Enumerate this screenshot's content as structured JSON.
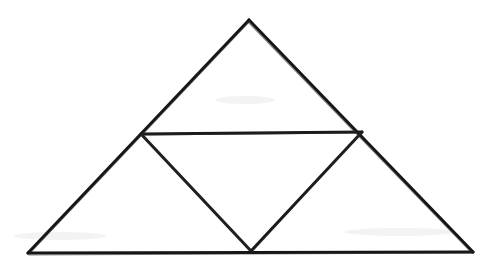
{
  "figure": {
    "background_color": "#ffffff",
    "stroke_color": "#161616",
    "stroke_width_px": 3,
    "width_px": 493,
    "height_px": 270,
    "style": "hand-drawn ink line drawing, scanned"
  },
  "vertices": {
    "apex": {
      "label": "apex",
      "x": 249,
      "y": 20
    },
    "bottom_left": {
      "label": "bottom-left",
      "x": 28,
      "y": 253
    },
    "bottom_right": {
      "label": "bottom-right",
      "x": 473,
      "y": 252
    },
    "left_midpoint": {
      "label": "left-midpoint",
      "x": 141,
      "y": 134
    },
    "right_midpoint": {
      "label": "right-midpoint",
      "x": 362,
      "y": 132
    },
    "bottom_midpoint": {
      "label": "bottom-midpoint",
      "x": 251,
      "y": 251
    }
  },
  "segments": [
    {
      "name": "outer-left-edge",
      "from": "apex",
      "to": "bottom_left",
      "path": "M 249 20 L 28 253"
    },
    {
      "name": "outer-right-edge",
      "from": "apex",
      "to": "bottom_right",
      "path": "M 249 20 L 473 252"
    },
    {
      "name": "outer-base-edge",
      "from": "bottom_left",
      "to": "bottom_right",
      "path": "M 28 253 L 473 252"
    },
    {
      "name": "medial-horizontal",
      "from": "left_midpoint",
      "to": "right_midpoint",
      "path": "M 141 134 L 362 132"
    },
    {
      "name": "medial-left-diagonal",
      "from": "left_midpoint",
      "to": "bottom_midpoint",
      "path": "M 141 134 L 251 251"
    },
    {
      "name": "medial-right-diagonal",
      "from": "bottom_midpoint",
      "to": "right_midpoint",
      "path": "M 251 251 L 362 132"
    }
  ],
  "regions": [
    {
      "name": "top-triangle",
      "vertices": [
        "apex",
        "left_midpoint",
        "right_midpoint"
      ]
    },
    {
      "name": "left-triangle",
      "vertices": [
        "left_midpoint",
        "bottom_left",
        "bottom_midpoint"
      ]
    },
    {
      "name": "right-triangle",
      "vertices": [
        "right_midpoint",
        "bottom_midpoint",
        "bottom_right"
      ]
    },
    {
      "name": "center-inverted-triangle",
      "vertices": [
        "left_midpoint",
        "right_midpoint",
        "bottom_midpoint"
      ]
    }
  ],
  "labels": {
    "visible_text": []
  }
}
